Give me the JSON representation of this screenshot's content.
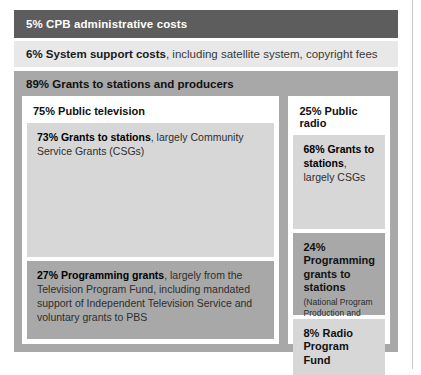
{
  "infographic": {
    "title_implied": "CPB funding allocation breakdown",
    "bands": {
      "admin": {
        "pct": "5%",
        "label": "5% CPB administrative costs",
        "color": "#5d5d5d"
      },
      "support": {
        "pct": "6%",
        "bold": "6% System support costs",
        "rest": ", including satellite system, copyright fees",
        "color": "#e8e8e8"
      },
      "grants": {
        "pct": "89%",
        "label": "89% Grants to stations and producers",
        "color": "#a8a8a8"
      }
    },
    "television": {
      "panel_title": "75% Public television",
      "items": [
        {
          "bold": "73% Grants to stations",
          "rest": ", largely Community Service Grants (CSGs)",
          "color": "#d7d7d7"
        },
        {
          "bold": "27% Programming grants",
          "rest": ", largely from the Television Program Fund, including mandated support of Independent Television Service and voluntary grants to PBS",
          "color": "#a8a8a8"
        }
      ]
    },
    "radio": {
      "panel_title": "25% Public radio",
      "items": [
        {
          "bold": "68% Grants to stations",
          "rest": ", largely CSGs",
          "color": "#d7d7d7"
        },
        {
          "bold": "24% Programming grants to stations",
          "paren": "(National Program Production and Acquisition Grants)",
          "color": "#a8a8a8"
        },
        {
          "bold": "8% Radio Program Fund",
          "rest": "",
          "color": "#d7d7d7"
        }
      ]
    }
  },
  "chart_data": {
    "type": "bar",
    "categories": [
      "CPB administrative costs",
      "System support costs",
      "Grants to stations and producers"
    ],
    "values": [
      5,
      6,
      89
    ],
    "xlabel": "",
    "ylabel": "Share of funding (%)",
    "ylim": [
      0,
      100
    ],
    "breakdown": {
      "Grants to stations and producers": {
        "Public television": {
          "value": 75,
          "children": {
            "Grants to stations (largely Community Service Grants, CSGs)": 73,
            "Programming grants (largely from the Television Program Fund, including mandated support of Independent Television Service and voluntary grants to PBS)": 27
          }
        },
        "Public radio": {
          "value": 25,
          "children": {
            "Grants to stations (largely CSGs)": 68,
            "Programming grants to stations (National Program Production and Acquisition Grants)": 24,
            "Radio Program Fund": 8
          }
        }
      }
    }
  }
}
